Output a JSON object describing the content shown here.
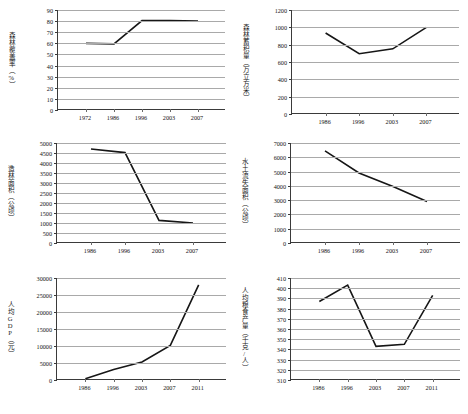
{
  "figure": {
    "caption": ""
  },
  "chart_data": [
    {
      "id": "forest-coverage",
      "type": "line",
      "title": "",
      "ylabel": "森林覆盖率（%）",
      "xlabel": "",
      "categories": [
        "1972",
        "1986",
        "1996",
        "2003",
        "2007"
      ],
      "values": [
        60,
        59.5,
        80.5,
        80.5,
        80
      ],
      "ylim": [
        0,
        90
      ],
      "yticks": [
        0,
        10,
        20,
        30,
        40,
        50,
        60,
        70,
        80,
        90
      ],
      "grid": true,
      "legend": "none",
      "series_color": "#161616"
    },
    {
      "id": "forest-stock-volume",
      "type": "line",
      "title": "",
      "ylabel": "森林蓄积量（万立方米）",
      "xlabel": "",
      "categories": [
        "1986",
        "1996",
        "2003",
        "2007"
      ],
      "values": [
        935,
        695,
        752,
        1000
      ],
      "ylim": [
        0,
        1200
      ],
      "yticks": [
        0,
        200,
        400,
        600,
        800,
        1000,
        1200
      ],
      "grid": true,
      "legend": "none",
      "series_color": "#161616"
    },
    {
      "id": "afforestation-area",
      "type": "line",
      "title": "",
      "ylabel": "造林面积（公顷）",
      "xlabel": "",
      "categories": [
        "1986",
        "1996",
        "2003",
        "2007"
      ],
      "values": [
        4700,
        4520,
        1130,
        1000
      ],
      "ylim": [
        0,
        5000
      ],
      "yticks": [
        0,
        500,
        1000,
        1500,
        2000,
        2500,
        3000,
        3500,
        4000,
        4500,
        5000
      ],
      "grid": true,
      "legend": "none",
      "series_color": "#161616"
    },
    {
      "id": "soil-erosion-area",
      "type": "line",
      "title": "",
      "ylabel": "水土流失面积（公顷）",
      "xlabel": "",
      "categories": [
        "1986",
        "1996",
        "2003",
        "2007"
      ],
      "values": [
        6450,
        4900,
        3950,
        2900
      ],
      "ylim": [
        0,
        7000
      ],
      "yticks": [
        0,
        1000,
        2000,
        3000,
        4000,
        5000,
        6000,
        7000
      ],
      "grid": true,
      "legend": "none",
      "series_color": "#161616"
    },
    {
      "id": "per-capita-gdp",
      "type": "line",
      "title": "",
      "ylabel": "人均GDP（元）",
      "xlabel": "",
      "categories": [
        "1986",
        "1996",
        "2003",
        "2007",
        "2011"
      ],
      "values": [
        400,
        3100,
        5300,
        10200,
        28000
      ],
      "ylim": [
        0,
        30000
      ],
      "yticks": [
        0,
        5000,
        10000,
        15000,
        20000,
        25000,
        30000
      ],
      "grid": true,
      "legend": "none",
      "series_color": "#161616"
    },
    {
      "id": "per-capita-grain-output",
      "type": "line",
      "title": "",
      "ylabel": "人均粮食产量（千克/人）",
      "xlabel": "",
      "categories": [
        "1986",
        "1996",
        "2003",
        "2007",
        "2011"
      ],
      "values": [
        387,
        403,
        343,
        345,
        393
      ],
      "ylim": [
        310,
        410
      ],
      "yticks": [
        310,
        320,
        330,
        340,
        350,
        360,
        370,
        380,
        390,
        400,
        410
      ],
      "grid": true,
      "legend": "none",
      "series_color": "#161616"
    }
  ]
}
